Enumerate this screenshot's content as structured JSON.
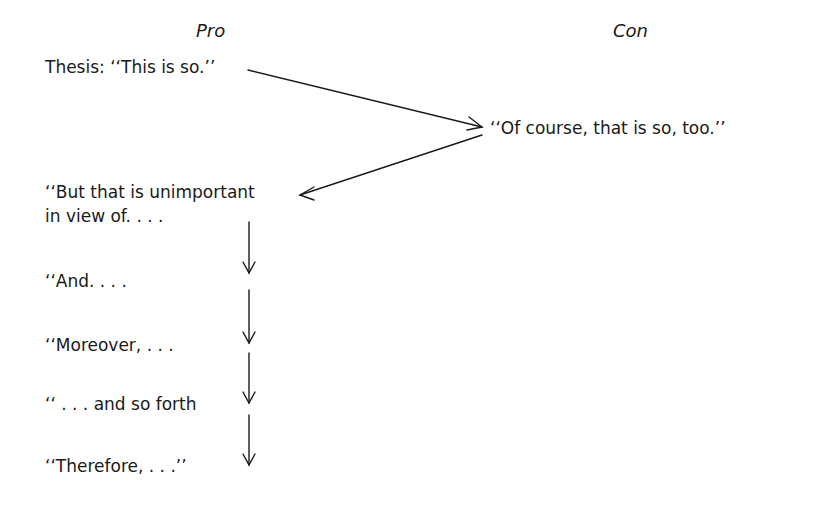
{
  "headers": {
    "pro": "Pro",
    "con": "Con"
  },
  "pro": {
    "thesis": "Thesis: ‘‘This is so.’’",
    "rebuttal_line1": "‘‘But that is unimportant",
    "rebuttal_line2": "in view of. . . .",
    "steps": [
      "‘‘And. . . .",
      "‘‘Moreover, . . .",
      "‘‘ . . . and so forth",
      "‘‘Therefore, . . .’’"
    ]
  },
  "con": {
    "concession": "‘‘Of course, that is so, too.’’"
  },
  "colors": {
    "ink": "#1a1a1a",
    "background": "#ffffff"
  }
}
